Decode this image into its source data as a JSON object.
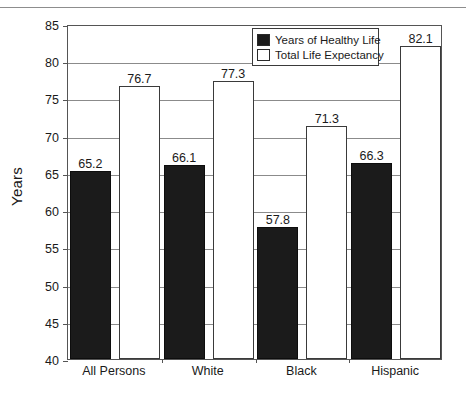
{
  "chart_data": {
    "type": "bar",
    "title": "",
    "xlabel": "",
    "ylabel": "Years",
    "ylim": [
      40,
      85
    ],
    "yticks": [
      40,
      45,
      50,
      55,
      60,
      65,
      70,
      75,
      80,
      85
    ],
    "grid": true,
    "legend_position": "top-center",
    "categories": [
      "All Persons",
      "White",
      "Black",
      "Hispanic"
    ],
    "series": [
      {
        "name": "Years of Healthy Life",
        "color": "#1b1b1b",
        "values": [
          65.2,
          66.1,
          57.8,
          66.3
        ],
        "labels": [
          "65.2",
          "66.1",
          "57.8",
          "66.3"
        ]
      },
      {
        "name": "Total Life Expectancy",
        "color": "#ffffff",
        "values": [
          76.7,
          77.3,
          71.3,
          82.1
        ],
        "labels": [
          "76.7",
          "77.3",
          "71.3",
          "82.1"
        ]
      }
    ]
  },
  "legend": {
    "entries": [
      {
        "label": "Years of Healthy Life",
        "swatch": "dark"
      },
      {
        "label": "Total Life Expectancy",
        "swatch": "light"
      }
    ]
  },
  "axis": {
    "y_title": "Years",
    "y_tick_labels": [
      "85",
      "80",
      "75",
      "70",
      "65",
      "60",
      "55",
      "50",
      "45",
      "40"
    ],
    "x_tick_labels": [
      "All Persons",
      "White",
      "Black",
      "Hispanic"
    ]
  },
  "caption_remnant": ""
}
